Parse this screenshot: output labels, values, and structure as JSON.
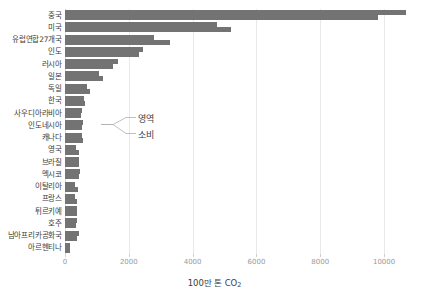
{
  "chart_data": {
    "type": "bar",
    "orientation": "horizontal",
    "title": "",
    "subtitle": "",
    "xlabel": "100만 톤 CO₂",
    "ylabel": "",
    "xlim": [
      0,
      11000
    ],
    "xticks": [
      0,
      2000,
      4000,
      6000,
      8000,
      10000
    ],
    "xtick_labels": [
      "0",
      "2000",
      "4000",
      "6000",
      "8000",
      "10000"
    ],
    "grid": true,
    "grid_axis": "x",
    "legend_position": "inline-annotation",
    "categories": [
      "중국",
      "미국",
      "유럽연합27개국",
      "인도",
      "러시아",
      "일본",
      "독일",
      "한국",
      "사우디아라비아",
      "인도네시아",
      "캐나다",
      "영국",
      "브라질",
      "멕시코",
      "이탈리아",
      "프랑스",
      "튀르키예",
      "호주",
      "남아프리카공화국",
      "아르헨티나"
    ],
    "series": [
      {
        "name": "영역",
        "color": "#737373",
        "values": [
          10700,
          4750,
          2800,
          2450,
          1650,
          1080,
          680,
          600,
          540,
          560,
          540,
          350,
          450,
          460,
          325,
          300,
          390,
          390,
          440,
          170
        ]
      },
      {
        "name": "소비",
        "color": "#737373",
        "values": [
          9800,
          5200,
          3300,
          2330,
          1500,
          1200,
          780,
          630,
          490,
          520,
          560,
          440,
          450,
          440,
          400,
          390,
          380,
          330,
          385,
          170
        ]
      }
    ],
    "annotations": [
      {
        "text": "영역",
        "series": "영역"
      },
      {
        "text": "소비",
        "series": "소비"
      }
    ],
    "colors": {
      "bar": "#737373",
      "gridline": "#e9e9e9",
      "tick_label": "#9a9a9a",
      "category_label": "#3c3c3c",
      "background": "#ffffff"
    }
  }
}
